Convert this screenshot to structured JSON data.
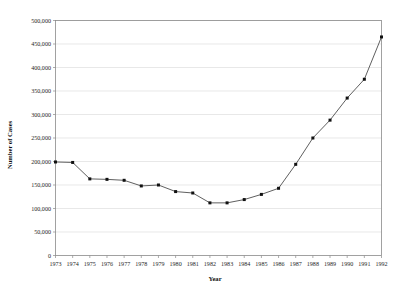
{
  "chart_data": {
    "type": "line",
    "title": "",
    "xlabel": "Year",
    "ylabel": "Number of Cases",
    "x": [
      1973,
      1974,
      1975,
      1976,
      1977,
      1978,
      1979,
      1980,
      1981,
      1982,
      1983,
      1984,
      1985,
      1986,
      1987,
      1988,
      1989,
      1990,
      1991,
      1992
    ],
    "values": [
      199000,
      198000,
      163000,
      162000,
      160000,
      148000,
      150000,
      136000,
      133000,
      112000,
      112000,
      119000,
      130000,
      143000,
      194000,
      250000,
      288000,
      335000,
      375000,
      465000
    ],
    "categories": [
      "1973",
      "1974",
      "1975",
      "1976",
      "1977",
      "1978",
      "1979",
      "1980",
      "1981",
      "1982",
      "1983",
      "1984",
      "1985",
      "1986",
      "1987",
      "1988",
      "1989",
      "1990",
      "1991",
      "1992"
    ],
    "series": [
      {
        "name": "Number of Cases",
        "values": [
          199000,
          198000,
          163000,
          162000,
          160000,
          148000,
          150000,
          136000,
          133000,
          112000,
          112000,
          119000,
          130000,
          143000,
          194000,
          250000,
          288000,
          335000,
          375000,
          465000
        ]
      }
    ],
    "ylim": [
      0,
      500000
    ],
    "xlim": [
      1973,
      1992
    ],
    "ytick_labels": [
      "0",
      "50,000",
      "100,000",
      "150,000",
      "200,000",
      "250,000",
      "300,000",
      "350,000",
      "400,000",
      "450,000",
      "500,000"
    ],
    "ytick_values": [
      0,
      50000,
      100000,
      150000,
      200000,
      250000,
      300000,
      350000,
      400000,
      450000,
      500000
    ],
    "xtick_labels": [
      "1973",
      "1974",
      "1975",
      "1976",
      "1977",
      "1978",
      "1979",
      "1980",
      "1981",
      "1982",
      "1983",
      "1984",
      "1985",
      "1986",
      "1987",
      "1988",
      "1989",
      "1990",
      "1991",
      "1992"
    ],
    "grid": true,
    "grid_axis": "y",
    "legend": false,
    "legend_position": "none",
    "marker": "square",
    "line_color": "#4d4d4d",
    "marker_color": "#111111",
    "grid_color": "#d8d8d8",
    "axis_color": "#8a8a8a",
    "background_color": "#ffffff"
  }
}
